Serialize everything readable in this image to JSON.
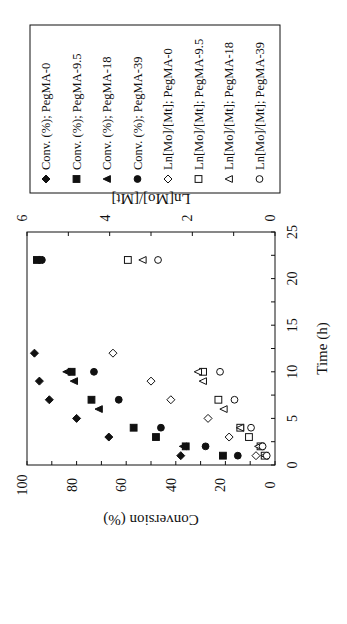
{
  "chart_data": {
    "type": "scatter",
    "orientation": "rotated-90-clockwise (time axis runs vertically, bottom=0)",
    "title": "",
    "xlabel": "Time (h)",
    "ylabel": "Conversion (%)",
    "y2label": "Ln[Mo]/[Mt]",
    "xlim": [
      0,
      25
    ],
    "ylim": [
      0,
      100
    ],
    "y2lim": [
      0,
      6
    ],
    "xticks": [
      "0",
      "5",
      "10",
      "15",
      "20",
      "25"
    ],
    "yticks": [
      "0",
      "20",
      "40",
      "60",
      "80",
      "100"
    ],
    "y2ticks": [
      "0",
      "2",
      "4",
      "6"
    ],
    "grid": false,
    "legend_position": "boxed, outside top",
    "series": [
      {
        "name": "Conv. (%); PegMA-0",
        "axis": "y",
        "marker": "diamond-filled",
        "x": [
          1,
          3,
          5,
          7,
          9,
          12,
          22
        ],
        "values": [
          38,
          67,
          80,
          91,
          95,
          97,
          95
        ]
      },
      {
        "name": "Conv. (%); PegMA-9.5",
        "axis": "y",
        "marker": "square-filled",
        "x": [
          1,
          2,
          3,
          4,
          7,
          10,
          22
        ],
        "values": [
          21,
          36,
          48,
          57,
          74,
          82,
          96
        ]
      },
      {
        "name": "Conv. (%); PegMA-18",
        "axis": "y",
        "marker": "triangle-filled",
        "x": [
          2,
          6,
          9,
          10,
          22
        ],
        "values": [
          37,
          71,
          81,
          84,
          95
        ]
      },
      {
        "name": "Conv. (%); PegMA-39",
        "axis": "y",
        "marker": "circle-filled",
        "x": [
          1,
          2,
          4,
          7,
          10,
          22
        ],
        "values": [
          15,
          28,
          46,
          63,
          73,
          94
        ]
      },
      {
        "name": "Ln[Mo]/[Mt]; PegMA-0",
        "axis": "y2",
        "marker": "diamond-open",
        "x": [
          1,
          3,
          5,
          7,
          9,
          12
        ],
        "values": [
          0.46,
          1.11,
          1.62,
          2.52,
          3.0,
          3.92
        ]
      },
      {
        "name": "Ln[Mo]/[Mt]; PegMA-9.5",
        "axis": "y2",
        "marker": "square-open",
        "x": [
          1,
          2,
          3,
          4,
          7,
          10,
          22
        ],
        "values": [
          0.25,
          0.35,
          0.63,
          0.84,
          1.37,
          1.74,
          3.56
        ]
      },
      {
        "name": "Ln[Mo]/[Mt]; PegMA-18",
        "axis": "y2",
        "marker": "triangle-open",
        "x": [
          1,
          2,
          4,
          6,
          9,
          10,
          22
        ],
        "values": [
          0.25,
          0.4,
          0.84,
          1.24,
          1.74,
          1.86,
          3.2
        ]
      },
      {
        "name": "Ln[Mo]/[Mt]; PegMA-39",
        "axis": "y2",
        "marker": "circle-open",
        "x": [
          1,
          2,
          4,
          7,
          10,
          22
        ],
        "values": [
          0.2,
          0.3,
          0.58,
          0.98,
          1.33,
          2.83
        ]
      }
    ]
  },
  "colors": {
    "ink": "#111111",
    "background": "#ffffff"
  }
}
